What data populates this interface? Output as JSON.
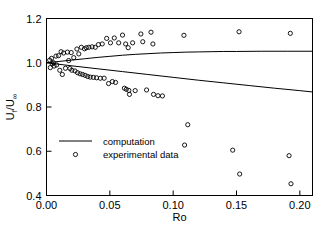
{
  "chart_data": {
    "type": "scatter",
    "title": "",
    "xlabel": "Ro",
    "ylabel": "U_f/U_∞",
    "ylabel_main": "U",
    "ylabel_sub1": "f",
    "ylabel_slash": "/U",
    "ylabel_sub2": "∞",
    "xlim": [
      0.0,
      0.21
    ],
    "ylim": [
      0.4,
      1.2
    ],
    "xticks": [
      0.0,
      0.05,
      0.1,
      0.15,
      0.2
    ],
    "xtick_labels": [
      "0.00",
      "0.05",
      "0.10",
      "0.15",
      "0.20"
    ],
    "yticks": [
      0.4,
      0.6,
      0.8,
      1.0,
      1.2
    ],
    "ytick_labels": [
      "0.4",
      "0.6",
      "0.8",
      "1.0",
      "1.2"
    ],
    "grid": false,
    "legend_position": "center-left",
    "legend": [
      {
        "label": "computation",
        "marker": "line"
      },
      {
        "label": "experimental data",
        "marker": "circle"
      }
    ],
    "series": [
      {
        "name": "computation",
        "type": "line",
        "comment": "upper computed branch",
        "points": [
          [
            0.0,
            1.0
          ],
          [
            0.01,
            1.006
          ],
          [
            0.02,
            1.012
          ],
          [
            0.03,
            1.018
          ],
          [
            0.04,
            1.024
          ],
          [
            0.05,
            1.029
          ],
          [
            0.06,
            1.034
          ],
          [
            0.07,
            1.038
          ],
          [
            0.08,
            1.041
          ],
          [
            0.09,
            1.044
          ],
          [
            0.1,
            1.046
          ],
          [
            0.11,
            1.048
          ],
          [
            0.12,
            1.049
          ],
          [
            0.13,
            1.05
          ],
          [
            0.14,
            1.051
          ],
          [
            0.15,
            1.051
          ],
          [
            0.17,
            1.052
          ],
          [
            0.19,
            1.052
          ],
          [
            0.21,
            1.052
          ]
        ]
      },
      {
        "name": "computation",
        "type": "line",
        "comment": "lower computed branch",
        "points": [
          [
            0.0,
            1.0
          ],
          [
            0.02,
            0.986
          ],
          [
            0.04,
            0.973
          ],
          [
            0.06,
            0.96
          ],
          [
            0.08,
            0.947
          ],
          [
            0.1,
            0.934
          ],
          [
            0.12,
            0.921
          ],
          [
            0.14,
            0.909
          ],
          [
            0.16,
            0.897
          ],
          [
            0.18,
            0.885
          ],
          [
            0.2,
            0.874
          ],
          [
            0.21,
            0.868
          ]
        ]
      },
      {
        "name": "experimental data",
        "type": "scatter",
        "marker": "open-circle",
        "points": [
          [
            0.0025,
            1.012
          ],
          [
            0.003,
            0.978
          ],
          [
            0.004,
            1.02
          ],
          [
            0.0045,
            0.995
          ],
          [
            0.0055,
            1.0
          ],
          [
            0.006,
            0.985
          ],
          [
            0.0075,
            1.03
          ],
          [
            0.008,
            0.99
          ],
          [
            0.0095,
            1.032
          ],
          [
            0.0105,
            0.966
          ],
          [
            0.0115,
            1.05
          ],
          [
            0.0125,
            0.947
          ],
          [
            0.0135,
            1.044
          ],
          [
            0.015,
            0.975
          ],
          [
            0.0165,
            1.048
          ],
          [
            0.0175,
            1.01
          ],
          [
            0.0185,
            0.974
          ],
          [
            0.0195,
            1.046
          ],
          [
            0.02,
            0.966
          ],
          [
            0.0215,
            1.023
          ],
          [
            0.0225,
            0.963
          ],
          [
            0.024,
            1.062
          ],
          [
            0.0245,
            0.955
          ],
          [
            0.0255,
            1.04
          ],
          [
            0.0265,
            0.95
          ],
          [
            0.0275,
            1.07
          ],
          [
            0.0285,
            0.947
          ],
          [
            0.03,
            1.063
          ],
          [
            0.0305,
            0.943
          ],
          [
            0.0315,
            1.068
          ],
          [
            0.0325,
            0.938
          ],
          [
            0.0335,
            1.07
          ],
          [
            0.0345,
            0.935
          ],
          [
            0.036,
            1.072
          ],
          [
            0.037,
            0.934
          ],
          [
            0.0385,
            1.07
          ],
          [
            0.0395,
            0.932
          ],
          [
            0.041,
            1.082
          ],
          [
            0.0425,
            0.93
          ],
          [
            0.044,
            1.085
          ],
          [
            0.0455,
            0.93
          ],
          [
            0.0475,
            1.11
          ],
          [
            0.049,
            0.906
          ],
          [
            0.0505,
            1.09
          ],
          [
            0.052,
            0.915
          ],
          [
            0.0535,
            1.112
          ],
          [
            0.0545,
            0.911
          ],
          [
            0.057,
            1.09
          ],
          [
            0.06,
            1.125
          ],
          [
            0.0615,
            0.885
          ],
          [
            0.0625,
            1.085
          ],
          [
            0.063,
            0.88
          ],
          [
            0.0645,
            1.068
          ],
          [
            0.065,
            0.875
          ],
          [
            0.0655,
            0.857
          ],
          [
            0.068,
            1.09
          ],
          [
            0.07,
            0.874
          ],
          [
            0.0745,
            1.13
          ],
          [
            0.076,
            1.095
          ],
          [
            0.079,
            0.877
          ],
          [
            0.0825,
            1.138
          ],
          [
            0.084,
            1.085
          ],
          [
            0.0845,
            0.857
          ],
          [
            0.088,
            0.851
          ],
          [
            0.0915,
            0.85
          ],
          [
            0.1085,
            1.124
          ],
          [
            0.109,
            0.628
          ],
          [
            0.1115,
            0.72
          ],
          [
            0.147,
            0.605
          ],
          [
            0.152,
            1.14
          ],
          [
            0.1525,
            0.497
          ],
          [
            0.1915,
            0.58
          ],
          [
            0.1925,
            1.133
          ],
          [
            0.193,
            0.453
          ]
        ]
      }
    ]
  },
  "axes": {
    "x_axis_name": "Ro",
    "y_axis_name": "U_f/U_infinity"
  }
}
